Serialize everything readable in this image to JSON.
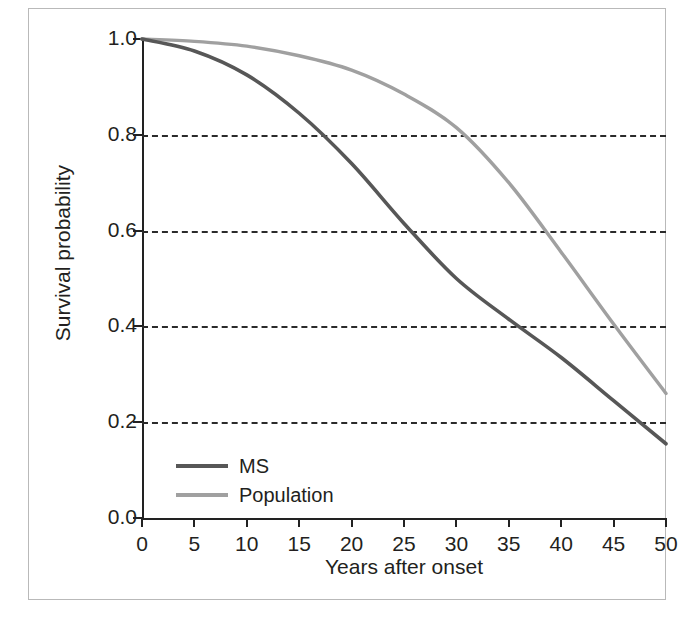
{
  "chart_data": {
    "type": "line",
    "title": "",
    "xlabel": "Years after onset",
    "ylabel": "Survival probability",
    "xlim": [
      0,
      50
    ],
    "ylim": [
      0.0,
      1.0
    ],
    "xticks": [
      "0",
      "5",
      "10",
      "15",
      "20",
      "25",
      "30",
      "35",
      "40",
      "45",
      "50"
    ],
    "xtick_values": [
      0,
      5,
      10,
      15,
      20,
      25,
      30,
      35,
      40,
      45,
      50
    ],
    "yticks": [
      "0.0",
      "0.2",
      "0.4",
      "0.6",
      "0.8",
      "1.0"
    ],
    "ytick_values": [
      0.0,
      0.2,
      0.4,
      0.6,
      0.8,
      1.0
    ],
    "grid": "horizontal dashed at 0.2, 0.4, 0.6, 0.8",
    "gridline_values": [
      0.2,
      0.4,
      0.6,
      0.8
    ],
    "legend_position": "lower left inside axes",
    "x": [
      0,
      5,
      10,
      15,
      20,
      25,
      30,
      35,
      40,
      45,
      50
    ],
    "series": [
      {
        "name": "MS",
        "color": "#575757",
        "values": [
          1.0,
          0.975,
          0.925,
          0.845,
          0.74,
          0.615,
          0.5,
          0.415,
          0.335,
          0.245,
          0.155
        ]
      },
      {
        "name": "Population",
        "color": "#a0a0a0",
        "values": [
          1.0,
          0.995,
          0.985,
          0.965,
          0.935,
          0.885,
          0.815,
          0.7,
          0.555,
          0.405,
          0.26
        ]
      }
    ]
  },
  "legend": {
    "items": [
      {
        "label": "MS",
        "color": "#575757"
      },
      {
        "label": "Population",
        "color": "#a0a0a0"
      }
    ]
  },
  "colors": {
    "ms_line": "#575757",
    "population_line": "#a0a0a0",
    "axis": "#222222",
    "grid": "#2b2b2b",
    "frame": "#b9b9b9",
    "text": "#231f20",
    "background": "#ffffff"
  }
}
